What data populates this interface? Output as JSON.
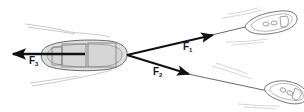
{
  "diagram": {
    "title": "",
    "colors": {
      "arrow": "#111111",
      "hull_fill": "#d9d9d9",
      "hull_stroke": "#555555",
      "wake": "#b5b5b5",
      "small_boat_stroke": "#6a6a6a"
    },
    "forces": [
      {
        "id": "F1",
        "base": "F",
        "sub": "1",
        "from": [
          127,
          55
        ],
        "to": [
          213,
          35
        ]
      },
      {
        "id": "F2",
        "base": "F",
        "sub": "2",
        "from": [
          127,
          55
        ],
        "to": [
          189,
          74
        ]
      },
      {
        "id": "F3",
        "base": "F",
        "sub": "3",
        "from": [
          85,
          54
        ],
        "to": [
          12,
          54
        ]
      }
    ],
    "boats": [
      {
        "name": "large-boat",
        "role": "towed"
      },
      {
        "name": "tug-upper",
        "role": "towing"
      },
      {
        "name": "tug-lower",
        "role": "towing"
      }
    ]
  }
}
